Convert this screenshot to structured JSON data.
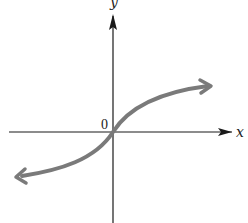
{
  "diagram": {
    "type": "function-graph",
    "axes": {
      "x_label": "x",
      "y_label": "y",
      "origin_label": "0"
    },
    "curve": {
      "description": "increasing S-shaped curve through origin, arrows at both ends",
      "color": "#7a7a7a"
    },
    "colors": {
      "axis": "#1a1a1a",
      "curve": "#7a7a7a",
      "background": "#ffffff"
    }
  }
}
